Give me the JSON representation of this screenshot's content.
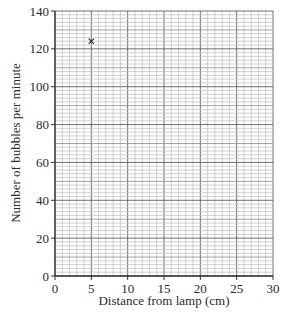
{
  "chart_data": {
    "type": "scatter",
    "title": "",
    "xlabel": "Distance from lamp (cm)",
    "ylabel": "Number of bubbles per minute",
    "xlim": [
      0,
      30
    ],
    "ylim": [
      0,
      140
    ],
    "x_ticks": [
      0,
      5,
      10,
      15,
      20,
      25,
      30
    ],
    "y_ticks": [
      0,
      20,
      40,
      60,
      80,
      100,
      120,
      140
    ],
    "x_tick_labels": [
      "0",
      "5",
      "10",
      "15",
      "20",
      "25",
      "30"
    ],
    "y_tick_labels": [
      "0",
      "20",
      "40",
      "60",
      "80",
      "100",
      "120",
      "140"
    ],
    "grid": {
      "on": true,
      "x_minor_step": 1,
      "x_major_step": 5,
      "y_minor_step": 2,
      "y_mid_step": 10,
      "y_major_step": 20
    },
    "series": [
      {
        "name": "plotted points",
        "marker": "x",
        "points": [
          {
            "x": 5,
            "y": 124
          }
        ]
      }
    ],
    "legend": null
  },
  "colors": {
    "axis": "#333333",
    "grid_major": "#6e6e6e",
    "grid_mid": "#9a9a9a",
    "grid_minor": "#c4c4c4",
    "marker": "#222222",
    "text": "#2a2a2a"
  }
}
